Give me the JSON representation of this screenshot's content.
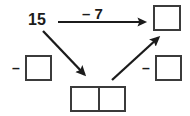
{
  "diagram": {
    "type": "number-bond-flow",
    "background_color": "#ffffff",
    "ink_color": "#1b1b1b",
    "box_border_color": "#3b3b3b",
    "start_number": {
      "text": "15",
      "x": 28,
      "y": 12
    },
    "operations": [
      {
        "name": "subtract-seven",
        "text": "– 7",
        "x": 82,
        "y": 6
      },
      {
        "name": "minus-left",
        "text": "–",
        "x": 12,
        "y": 61
      },
      {
        "name": "minus-right",
        "text": "–",
        "x": 142,
        "y": 61
      }
    ],
    "boxes": [
      {
        "name": "result-box-top-right",
        "kind": "single",
        "value": "",
        "x": 153,
        "y": 5,
        "width": 28,
        "height": 26
      },
      {
        "name": "operand-box-left",
        "kind": "single",
        "value": "",
        "x": 25,
        "y": 55,
        "width": 27,
        "height": 26
      },
      {
        "name": "operand-box-right",
        "kind": "single",
        "value": "",
        "x": 155,
        "y": 55,
        "width": 27,
        "height": 26
      },
      {
        "name": "partitioned-box-bottom",
        "kind": "split-two",
        "cells": [
          "",
          ""
        ],
        "x": 70,
        "y": 86,
        "width": 56,
        "height": 26
      }
    ],
    "arrows": [
      {
        "name": "arrow-horizontal-right",
        "from": [
          58,
          22
        ],
        "to": [
          151,
          22
        ]
      },
      {
        "name": "arrow-diagonal-down-right",
        "from": [
          43,
          31
        ],
        "to": [
          88,
          80
        ]
      },
      {
        "name": "arrow-diagonal-up-right",
        "from": [
          112,
          80
        ],
        "to": [
          162,
          33
        ]
      }
    ]
  }
}
